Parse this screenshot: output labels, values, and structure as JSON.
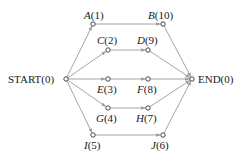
{
  "diagram": {
    "type": "network-graph",
    "colors": {
      "edge": "#9a9a9a",
      "node_stroke": "#333333",
      "text": "#1a1a1a"
    },
    "nodes": [
      {
        "id": "START",
        "name": "START",
        "value": "0",
        "label": "START(0)",
        "x": 66,
        "y": 79,
        "label_x": 8,
        "label_y": 83,
        "anchor": "start",
        "italic": false
      },
      {
        "id": "A",
        "name": "A",
        "value": "1",
        "label": "A(1)",
        "x": 93,
        "y": 24,
        "label_x": 84,
        "label_y": 19,
        "anchor": "start",
        "italic": true
      },
      {
        "id": "B",
        "name": "B",
        "value": "10",
        "label": "B(10)",
        "x": 163,
        "y": 24,
        "label_x": 148,
        "label_y": 19,
        "anchor": "start",
        "italic": true
      },
      {
        "id": "C",
        "name": "C",
        "value": "2",
        "label": "C(2)",
        "x": 108,
        "y": 50,
        "label_x": 97,
        "label_y": 44,
        "anchor": "start",
        "italic": true
      },
      {
        "id": "D",
        "name": "D",
        "value": "9",
        "label": "D(9)",
        "x": 148,
        "y": 50,
        "label_x": 137,
        "label_y": 44,
        "anchor": "start",
        "italic": true
      },
      {
        "id": "E",
        "name": "E",
        "value": "3",
        "label": "E(3)",
        "x": 108,
        "y": 79,
        "label_x": 97,
        "label_y": 93,
        "anchor": "start",
        "italic": true
      },
      {
        "id": "F",
        "name": "F",
        "value": "8",
        "label": "F(8)",
        "x": 148,
        "y": 79,
        "label_x": 137,
        "label_y": 93,
        "anchor": "start",
        "italic": true
      },
      {
        "id": "G",
        "name": "G",
        "value": "4",
        "label": "G(4)",
        "x": 108,
        "y": 108,
        "label_x": 96,
        "label_y": 122,
        "anchor": "start",
        "italic": true
      },
      {
        "id": "H",
        "name": "H",
        "value": "7",
        "label": "H(7)",
        "x": 148,
        "y": 108,
        "label_x": 136,
        "label_y": 122,
        "anchor": "start",
        "italic": true
      },
      {
        "id": "I",
        "name": "I",
        "value": "5",
        "label": "I(5)",
        "x": 93,
        "y": 135,
        "label_x": 84,
        "label_y": 149,
        "anchor": "start",
        "italic": true
      },
      {
        "id": "J",
        "name": "J",
        "value": "6",
        "label": "J(6)",
        "x": 163,
        "y": 135,
        "label_x": 151,
        "label_y": 149,
        "anchor": "start",
        "italic": true
      },
      {
        "id": "END",
        "name": "END",
        "value": "0",
        "label": "END(0)",
        "x": 192,
        "y": 79,
        "label_x": 198,
        "label_y": 83,
        "anchor": "start",
        "italic": false
      }
    ],
    "edges": [
      {
        "from": "START",
        "to": "A"
      },
      {
        "from": "START",
        "to": "C"
      },
      {
        "from": "START",
        "to": "E"
      },
      {
        "from": "START",
        "to": "G"
      },
      {
        "from": "START",
        "to": "I"
      },
      {
        "from": "A",
        "to": "B"
      },
      {
        "from": "C",
        "to": "D"
      },
      {
        "from": "E",
        "to": "F"
      },
      {
        "from": "G",
        "to": "H"
      },
      {
        "from": "I",
        "to": "J"
      },
      {
        "from": "B",
        "to": "END"
      },
      {
        "from": "D",
        "to": "END"
      },
      {
        "from": "F",
        "to": "END"
      },
      {
        "from": "H",
        "to": "END"
      },
      {
        "from": "J",
        "to": "END"
      }
    ]
  }
}
